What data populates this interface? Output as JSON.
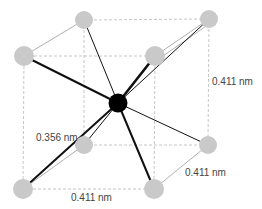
{
  "diagram": {
    "type": "tetrahedral-interstitial-crystal-cell",
    "colors": {
      "corner_atom": "#c9c9c9",
      "center_atom": "#000000",
      "bond": "#111111",
      "cell_edge": "#b8b8b8"
    },
    "labels": {
      "height": "0.411 nm",
      "bond_length": "0.356 nm",
      "depth": "0.411 nm",
      "width": "0.411 nm"
    },
    "atoms": [
      {
        "id": "back-top-left",
        "x": 84,
        "y": 20
      },
      {
        "id": "back-top-right",
        "x": 209,
        "y": 19
      },
      {
        "id": "front-top-left",
        "x": 24,
        "y": 56
      },
      {
        "id": "front-top-right",
        "x": 155,
        "y": 56
      },
      {
        "id": "back-bottom-left",
        "x": 84,
        "y": 145
      },
      {
        "id": "back-bottom-right",
        "x": 208,
        "y": 145
      },
      {
        "id": "front-bottom-left",
        "x": 23,
        "y": 189
      },
      {
        "id": "front-bottom-right",
        "x": 154,
        "y": 189
      }
    ],
    "center_atom": {
      "x": 118,
      "y": 103
    }
  }
}
